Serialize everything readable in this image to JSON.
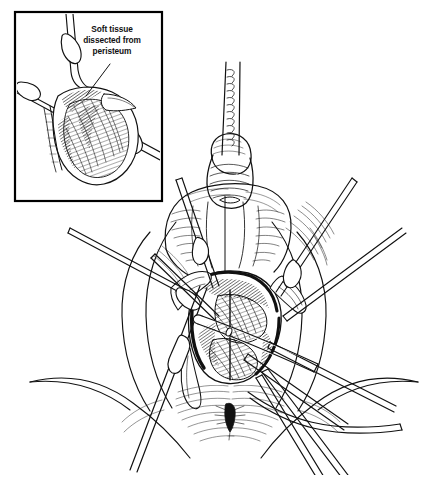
{
  "figure": {
    "style": "pen-and-ink line drawing, black on white",
    "background_color": "#ffffff",
    "ink_color": "#111111",
    "width": 445,
    "height": 489
  },
  "inset": {
    "name": "detail-inset",
    "border_color": "#000000",
    "x": 15,
    "y": 12,
    "width": 147,
    "height": 189,
    "caption_lines": [
      "Soft tissue",
      "dissected from",
      "peristeum"
    ],
    "caption_full": "Soft tissue dissected from peristeum",
    "leader_line": {
      "from_x": 110,
      "from_y": 64,
      "to_x": 86,
      "to_y": 96
    }
  },
  "main_scene": {
    "name": "perineal-operative-field",
    "structures": [
      {
        "name": "penis-with-catheter",
        "label": ""
      },
      {
        "name": "scrotum",
        "label": ""
      },
      {
        "name": "left-thigh",
        "label": ""
      },
      {
        "name": "right-thigh",
        "label": ""
      },
      {
        "name": "perineal-incision",
        "label": ""
      },
      {
        "name": "exposed-muscle-bulbospongiosus",
        "label": ""
      },
      {
        "name": "anus",
        "label": ""
      }
    ],
    "instruments": [
      {
        "name": "catheter-tube",
        "label": ""
      },
      {
        "name": "retractor-upper-left",
        "label": ""
      },
      {
        "name": "retractor-mid-left",
        "label": ""
      },
      {
        "name": "retractor-lower-left",
        "label": ""
      },
      {
        "name": "retractor-upper-right",
        "label": ""
      },
      {
        "name": "retractor-mid-right",
        "label": ""
      },
      {
        "name": "retractor-lower-right",
        "label": ""
      },
      {
        "name": "dissecting-forceps",
        "label": ""
      }
    ]
  },
  "bottom_caption": {
    "text": ""
  }
}
